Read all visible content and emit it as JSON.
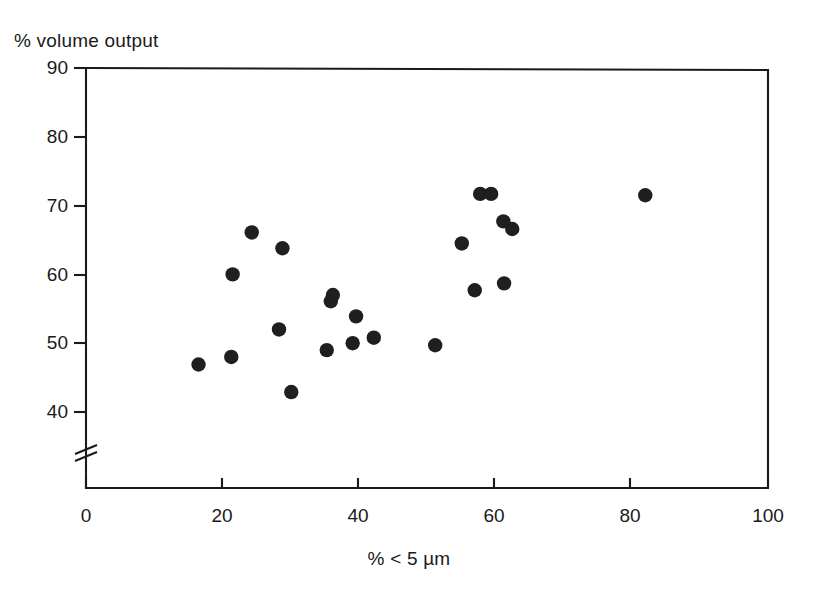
{
  "chart_data": {
    "type": "scatter",
    "title": "",
    "ylabel": "% volume output",
    "xlabel": "% < 5 µm",
    "xlim": [
      0,
      100
    ],
    "ylim": [
      40,
      90
    ],
    "y_axis_break": true,
    "y_axis_break_note": "axis broken below 40",
    "grid": false,
    "legend": null,
    "xticks": [
      0,
      20,
      40,
      60,
      80,
      100
    ],
    "yticks": [
      40,
      50,
      60,
      70,
      80,
      90
    ],
    "xtick_labels": [
      "0",
      "20",
      "40",
      "60",
      "80",
      "100"
    ],
    "ytick_labels": [
      "40",
      "50",
      "60",
      "70",
      "80",
      "90"
    ],
    "marker": "filled-circle",
    "marker_color": "#1f1f1f",
    "points": [
      {
        "x": 16.5,
        "y": 46.9
      },
      {
        "x": 21.3,
        "y": 48.0
      },
      {
        "x": 21.5,
        "y": 60.0
      },
      {
        "x": 24.3,
        "y": 66.1
      },
      {
        "x": 28.3,
        "y": 52.0
      },
      {
        "x": 28.8,
        "y": 63.8
      },
      {
        "x": 30.1,
        "y": 42.9
      },
      {
        "x": 35.3,
        "y": 49.0
      },
      {
        "x": 35.9,
        "y": 56.1
      },
      {
        "x": 36.2,
        "y": 57.0
      },
      {
        "x": 39.1,
        "y": 50.0
      },
      {
        "x": 39.6,
        "y": 53.9
      },
      {
        "x": 42.2,
        "y": 50.8
      },
      {
        "x": 51.2,
        "y": 49.7
      },
      {
        "x": 55.1,
        "y": 64.5
      },
      {
        "x": 57.0,
        "y": 57.7
      },
      {
        "x": 57.8,
        "y": 71.7
      },
      {
        "x": 59.4,
        "y": 71.7
      },
      {
        "x": 61.2,
        "y": 67.7
      },
      {
        "x": 61.3,
        "y": 58.7
      },
      {
        "x": 62.5,
        "y": 66.6
      },
      {
        "x": 82.0,
        "y": 71.5
      }
    ]
  }
}
